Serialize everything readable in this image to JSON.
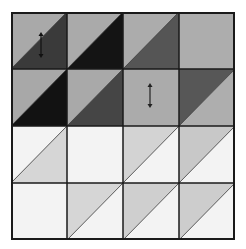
{
  "diagram": {
    "title": "",
    "rows": 4,
    "cols": 4,
    "grid_line_color": "#1a1a1a",
    "cells": [
      [
        {
          "type": "split",
          "upper_left": "#a9a9a9",
          "lower_right": "#3a3a3a",
          "arrow": true
        },
        {
          "type": "split",
          "upper_left": "#aaaaaa",
          "lower_right": "#141414",
          "arrow": false
        },
        {
          "type": "split",
          "upper_left": "#acacac",
          "lower_right": "#555555",
          "arrow": false
        },
        {
          "type": "plain",
          "fill": "#adadad",
          "arrow": false
        }
      ],
      [
        {
          "type": "split",
          "upper_left": "#a8a8a8",
          "lower_right": "#121212",
          "arrow": false
        },
        {
          "type": "split",
          "upper_left": "#a9a9a9",
          "lower_right": "#454545",
          "arrow": false
        },
        {
          "type": "plain",
          "fill": "#ababab",
          "arrow": true
        },
        {
          "type": "split",
          "upper_left": "#575757",
          "lower_right": "#aeaeae",
          "arrow": false
        }
      ],
      [
        {
          "type": "split",
          "upper_left": "#f3f3f3",
          "lower_right": "#d6d6d6",
          "arrow": false
        },
        {
          "type": "plain",
          "fill": "#f3f3f3",
          "arrow": false
        },
        {
          "type": "split",
          "upper_left": "#d3d3d3",
          "lower_right": "#f3f3f3",
          "arrow": false
        },
        {
          "type": "split",
          "upper_left": "#c8c8c8",
          "lower_right": "#f3f3f3",
          "arrow": false
        }
      ],
      [
        {
          "type": "plain",
          "fill": "#f3f3f3",
          "arrow": false
        },
        {
          "type": "split",
          "upper_left": "#d6d6d6",
          "lower_right": "#f3f3f3",
          "arrow": false
        },
        {
          "type": "split",
          "upper_left": "#cfcfcf",
          "lower_right": "#f3f3f3",
          "arrow": false
        },
        {
          "type": "split",
          "upper_left": "#cdcdcd",
          "lower_right": "#f3f3f3",
          "arrow": false
        }
      ]
    ],
    "arrows": [
      {
        "row": 0,
        "col": 0,
        "orientation": "vertical",
        "style": "double-headed"
      },
      {
        "row": 1,
        "col": 2,
        "orientation": "vertical",
        "style": "double-headed"
      }
    ]
  }
}
